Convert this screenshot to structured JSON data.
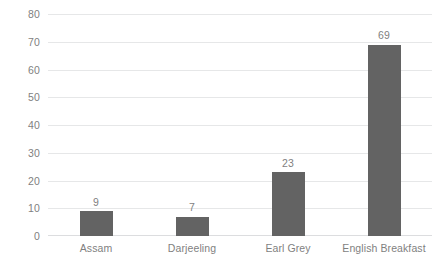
{
  "chart_data": {
    "type": "bar",
    "title": "",
    "subtitle": "",
    "xlabel": "",
    "ylabel": "",
    "categories": [
      "Assam",
      "Darjeeling",
      "Earl Grey",
      "English Breakfast"
    ],
    "values": [
      9,
      7,
      23,
      69
    ],
    "value_labels": [
      "9",
      "7",
      "23",
      "69"
    ],
    "ylim": [
      0,
      80
    ],
    "ytick_step": 10,
    "ytick_labels": [
      "80",
      "70",
      "60",
      "50",
      "40",
      "30",
      "20",
      "10",
      "0"
    ],
    "ytick_values": [
      80,
      70,
      60,
      50,
      40,
      30,
      20,
      10,
      0
    ],
    "grid": "horizontal",
    "legend": "none",
    "show_data_labels": true,
    "colors": {
      "background": "#ffffff",
      "bar": "#636363",
      "gridline": "#e6e7e8",
      "axis_line": "#dcdddf",
      "tick_label": "#7f7f7f",
      "data_label": "#7f7f7f"
    }
  }
}
